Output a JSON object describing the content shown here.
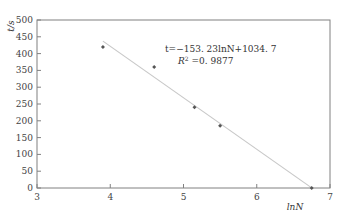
{
  "chart_data": {
    "type": "scatter",
    "title": "",
    "xlabel": "lnN",
    "ylabel": "t/s",
    "xlim": [
      3,
      7
    ],
    "ylim": [
      0,
      500
    ],
    "xticks": [
      3,
      4,
      5,
      6,
      7
    ],
    "yticks": [
      0,
      50,
      100,
      150,
      200,
      250,
      300,
      350,
      400,
      450,
      500
    ],
    "grid": false,
    "legend": null,
    "series": [
      {
        "name": "data",
        "marker": "diamond",
        "x": [
          3.9,
          4.6,
          5.15,
          5.5,
          6.75
        ],
        "y": [
          420,
          360,
          240,
          185,
          0
        ]
      }
    ],
    "trendline": {
      "type": "linear",
      "slope": -153.23,
      "intercept": 1034.7,
      "x_range": [
        3.9,
        6.75
      ]
    },
    "annotations": [
      "t=−153. 23lnN+1034. 7",
      "R² =0. 9877"
    ]
  },
  "labels": {
    "ylabel": "t/s",
    "xlabel": "lnN",
    "equation": "t=−153. 23lnN+1034. 7",
    "r2_prefix": "R",
    "r2_sup": "2",
    "r2_value": " =0. 9877"
  },
  "colors": {
    "axis": "#808080",
    "trendline": "#c8c8c8",
    "marker": "#555555"
  }
}
